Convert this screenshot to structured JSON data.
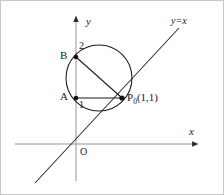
{
  "figure": {
    "type": "geometry-diagram",
    "background_color": "#ffffff",
    "stroke_color": "#1a1a1a",
    "axis_color": "#7a7a7a",
    "width": 224,
    "height": 195,
    "axes": {
      "x_axis_label": "x",
      "y_axis_label": "y",
      "origin_label": "O",
      "origin_px": {
        "x": 75,
        "y": 143
      },
      "x_axis_from_px": {
        "x": 14,
        "y": 143
      },
      "x_axis_to_px": {
        "x": 200,
        "y": 143
      },
      "y_axis_from_px": {
        "x": 75,
        "y": 180
      },
      "y_axis_to_px": {
        "x": 75,
        "y": 14
      },
      "arrowheads": [
        "x-axis-right",
        "y-axis-up"
      ]
    },
    "ticks": [
      {
        "label": "1",
        "axis": "y",
        "value": 1,
        "px": {
          "x": 75,
          "y": 97
        }
      },
      {
        "label": "2",
        "axis": "y",
        "value": 2,
        "px": {
          "x": 75,
          "y": 56
        }
      }
    ],
    "points": [
      {
        "name": "B",
        "label": "B",
        "coords": [
          0,
          2
        ],
        "px": {
          "x": 75,
          "y": 56
        },
        "on": "y-axis",
        "filled": true
      },
      {
        "name": "A",
        "label": "A",
        "coords": [
          0,
          1
        ],
        "px": {
          "x": 75,
          "y": 97
        },
        "on": "y-axis",
        "filled": true
      },
      {
        "name": "P0",
        "label": "P",
        "label_sub": "0",
        "label_coords": "(1,1)",
        "coords": [
          1,
          1
        ],
        "px": {
          "x": 121,
          "y": 97
        },
        "on": "circle-and-line",
        "filled": true
      }
    ],
    "circle": {
      "center_px": {
        "x": 98,
        "y": 77
      },
      "radius_px": 33,
      "passes_through": [
        "A",
        "B",
        "P0"
      ]
    },
    "chords": [
      {
        "name": "chord-B-P0",
        "from": "B",
        "to": "P0",
        "is_diameter": true
      },
      {
        "name": "chord-A-P0",
        "from": "A",
        "to": "P0",
        "is_diameter": false
      }
    ],
    "lines": [
      {
        "name": "line-y-equals-x",
        "equation": "y=x",
        "from_px": {
          "x": 34,
          "y": 182
        },
        "to_px": {
          "x": 178,
          "y": 27
        },
        "tangent_at": "P0"
      }
    ],
    "labels": {
      "y_axis": {
        "text": "y",
        "px": {
          "x": 85,
          "y": 17
        }
      },
      "x_axis": {
        "text": "x",
        "px": {
          "x": 188,
          "y": 127
        }
      },
      "origin": {
        "text": "O",
        "px": {
          "x": 79,
          "y": 147
        }
      },
      "point_b": {
        "text": "B",
        "px": {
          "x": 60,
          "y": 50
        }
      },
      "point_a": {
        "text": "A",
        "px": {
          "x": 60,
          "y": 91
        }
      },
      "tick_2": {
        "text": "2",
        "px": {
          "x": 78,
          "y": 41
        }
      },
      "tick_1": {
        "text": "1",
        "px": {
          "x": 78,
          "y": 100
        }
      },
      "point_p0": {
        "text": "P",
        "sub": "0",
        "rest": "(1,1)",
        "px": {
          "x": 126,
          "y": 92
        }
      },
      "line_eq": {
        "text": "y=x",
        "px": {
          "x": 170,
          "y": 17
        }
      }
    }
  }
}
